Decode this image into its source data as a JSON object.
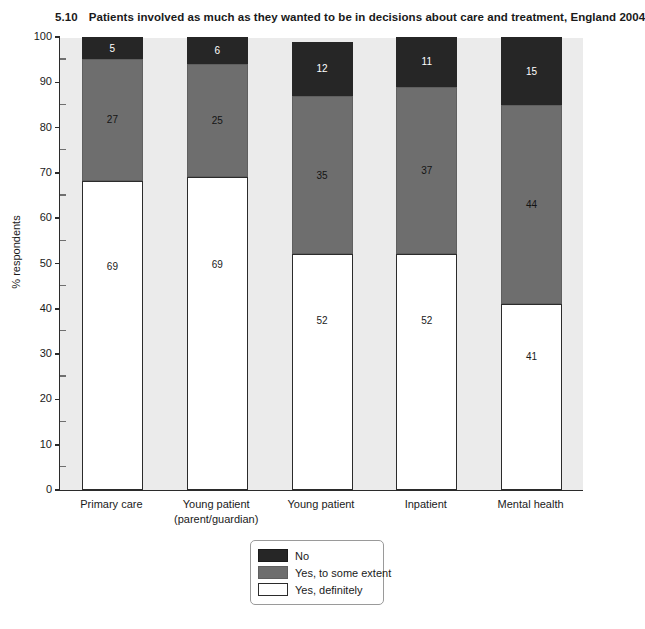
{
  "title": {
    "number": "5.10",
    "text": "Patients involved as much as they wanted to be in decisions about care and treatment, England 2004"
  },
  "chart_data": {
    "type": "bar",
    "subtype": "stacked-100-percent",
    "title": "Patients involved as much as they wanted to be in decisions about care and treatment, England 2004",
    "xlabel": "",
    "ylabel": "% respondents",
    "ylim": [
      0,
      100
    ],
    "yticks": [
      0,
      10,
      20,
      30,
      40,
      50,
      60,
      70,
      80,
      90,
      100
    ],
    "ytick_labels": [
      "0",
      "10",
      "20",
      "30",
      "40",
      "50",
      "60",
      "70",
      "80",
      "90",
      "100"
    ],
    "y_minor_ticks": [
      5,
      15,
      25,
      35,
      45,
      55,
      65,
      75,
      85,
      95
    ],
    "grid": false,
    "legend_position": "bottom-center",
    "categories": [
      "Primary care",
      "Young patient\n(parent/guardian)",
      "Young patient",
      "Inpatient",
      "Mental health"
    ],
    "series": [
      {
        "name": "Yes, definitely",
        "color": "#ffffff",
        "values": [
          69,
          69,
          52,
          52,
          41
        ]
      },
      {
        "name": "Yes, to some extent",
        "color": "#6e6e6e",
        "values": [
          27,
          25,
          35,
          37,
          44
        ]
      },
      {
        "name": "No",
        "color": "#262626",
        "values": [
          5,
          6,
          12,
          11,
          15
        ]
      }
    ],
    "stack_order_bottom_to_top": [
      "Yes, definitely",
      "Yes, to some extent",
      "No"
    ],
    "data_labels": [
      {
        "category": "Primary care",
        "definitely": "69",
        "some_extent": "27",
        "no": "5"
      },
      {
        "category": "Young patient (parent/guardian)",
        "definitely": "69",
        "some_extent": "25",
        "no": "6"
      },
      {
        "category": "Young patient",
        "definitely": "52",
        "some_extent": "35",
        "no": "12"
      },
      {
        "category": "Inpatient",
        "definitely": "52",
        "some_extent": "37",
        "no": "11"
      },
      {
        "category": "Mental health",
        "definitely": "41",
        "some_extent": "44",
        "no": "15"
      }
    ]
  },
  "legend": {
    "items": [
      {
        "label": "No",
        "color": "#262626"
      },
      {
        "label": "Yes, to some extent",
        "color": "#6e6e6e"
      },
      {
        "label": "Yes, definitely",
        "color": "#ffffff"
      }
    ]
  },
  "colors": {
    "plot_background": "#ebebeb",
    "axis": "#2b2b2b",
    "no": "#262626",
    "some_extent": "#6e6e6e",
    "definitely": "#ffffff"
  }
}
